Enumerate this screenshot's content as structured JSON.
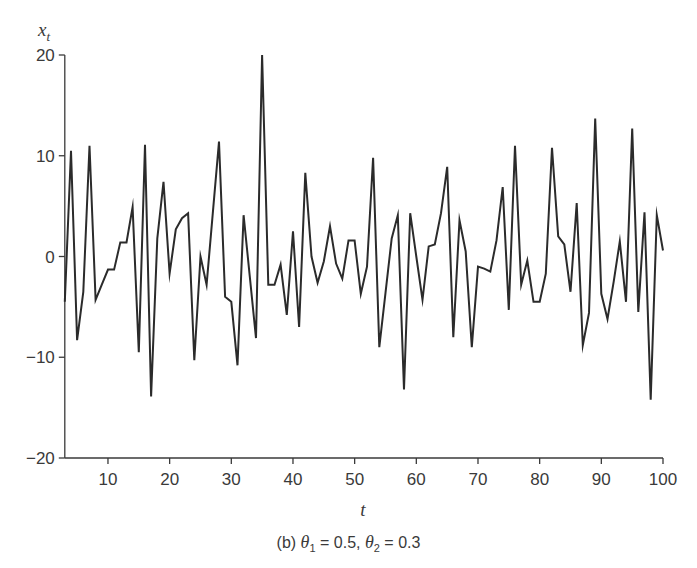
{
  "chart_data": {
    "type": "line",
    "title": "",
    "caption": "(b) θ1 = 0.5, θ2 = 0.3",
    "xlabel": "t",
    "ylabel": "x_t",
    "xlim": [
      3,
      100
    ],
    "ylim": [
      -20,
      20
    ],
    "x_ticks": [
      10,
      20,
      30,
      40,
      50,
      60,
      70,
      80,
      90,
      100
    ],
    "y_ticks": [
      -20,
      -10,
      0,
      10,
      20
    ],
    "grid": false,
    "legend": null,
    "line_color": "#2b2b2b",
    "series": [
      {
        "name": "x_t",
        "x_start": 3,
        "x_end": 100,
        "values": [
          -4.5,
          10.5,
          -8.3,
          -3.5,
          11.0,
          -4.3,
          -2.8,
          -1.3,
          -1.3,
          1.4,
          1.4,
          4.9,
          -9.5,
          11.1,
          -13.9,
          1.8,
          7.4,
          -1.7,
          2.7,
          3.8,
          4.3,
          -10.3,
          0.0,
          -2.8,
          4.3,
          11.4,
          -4.0,
          -4.5,
          -10.8,
          4.1,
          -2.0,
          -8.1,
          20.0,
          -2.8,
          -2.8,
          -0.8,
          -5.8,
          2.5,
          -7.0,
          8.3,
          0.0,
          -2.6,
          -0.5,
          3.0,
          -0.7,
          -2.2,
          1.6,
          1.6,
          -3.7,
          -1.0,
          9.8,
          -9.0,
          -3.6,
          1.8,
          4.1,
          -13.2,
          4.3,
          0.0,
          -4.3,
          1.0,
          1.2,
          4.3,
          8.9,
          -8.0,
          3.6,
          0.5,
          -9.0,
          -1.0,
          -1.2,
          -1.5,
          1.6,
          6.9,
          -5.3,
          11.0,
          -2.8,
          -0.4,
          -4.5,
          -4.5,
          -1.7,
          10.8,
          2.0,
          1.2,
          -3.5,
          5.3,
          -8.8,
          -5.6,
          13.7,
          -3.7,
          -6.2,
          -2.5,
          1.5,
          -4.5,
          12.7,
          -5.5,
          4.4,
          -14.2,
          4.1,
          0.6
        ]
      }
    ]
  },
  "labels": {
    "ylabel_main": "x",
    "ylabel_sub": "t",
    "xlabel": "t",
    "caption_prefix": "(b) ",
    "theta": "θ",
    "theta1_sub": "1",
    "theta1_value": " = 0.5, ",
    "theta2_sub": "2",
    "theta2_value": " = 0.3"
  }
}
